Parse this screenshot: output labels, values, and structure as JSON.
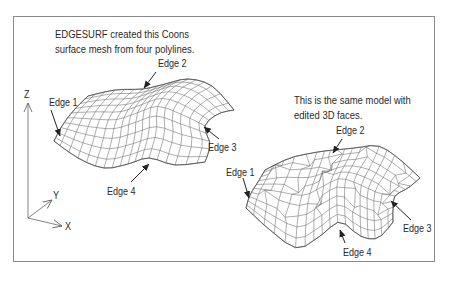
{
  "figure": {
    "left_caption": {
      "line1": "EDGESURF created this Coons",
      "line2": "surface mesh from four polylines."
    },
    "right_caption": {
      "line1": "This is the same model with",
      "line2": "edited 3D faces."
    },
    "left_mesh": {
      "labels": {
        "edge1": "Edge 1",
        "edge2": "Edge 2",
        "edge3": "Edge 3",
        "edge4": "Edge 4"
      }
    },
    "right_mesh": {
      "labels": {
        "edge1": "Edge 1",
        "edge2": "Edge 2",
        "edge3": "Edge 3",
        "edge4": "Edge 4"
      }
    },
    "axes": {
      "x": "X",
      "y": "Y",
      "z": "Z"
    },
    "colors": {
      "line": "#3a3a3a",
      "mesh": "#6a6a6a",
      "frame": "#8a8a8a"
    }
  }
}
